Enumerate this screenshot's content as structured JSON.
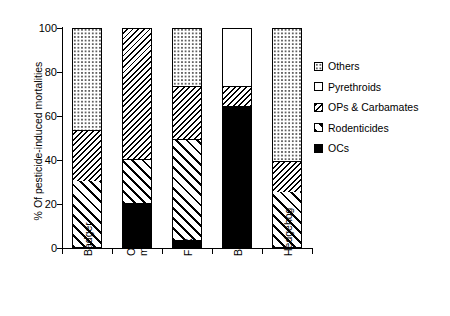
{
  "chart_data": {
    "type": "bar",
    "subtype": "stacked-bar-100",
    "title": "",
    "xlabel": "",
    "ylabel": "% Of pesticide-induced mortalities",
    "ylim": [
      0,
      100
    ],
    "yticks": [
      0,
      20,
      40,
      60,
      80,
      100
    ],
    "grid": false,
    "legend_position": "right",
    "categories": [
      "Badger",
      "Other mustelids",
      "Fox",
      "Bats",
      "Hedgehog"
    ],
    "series": [
      {
        "name": "OCs",
        "pattern": "solid-black",
        "values": [
          0,
          20,
          3,
          64,
          0
        ]
      },
      {
        "name": "Rodenticides",
        "pattern": "diagonal-hatch-forward",
        "values": [
          30,
          20,
          46,
          0,
          25
        ]
      },
      {
        "name": "OPs & Carbamates",
        "pattern": "diagonal-hatch-back",
        "values": [
          23,
          60,
          24,
          9,
          14
        ]
      },
      {
        "name": "Pyrethroids",
        "pattern": "white",
        "values": [
          0,
          0,
          0,
          27,
          0
        ]
      },
      {
        "name": "Others",
        "pattern": "dotted",
        "values": [
          47,
          0,
          27,
          0,
          61
        ]
      }
    ]
  },
  "axis": {
    "y_title": "% Of pesticide-induced mortalities",
    "y_tick_labels": [
      "100",
      "80",
      "60",
      "40",
      "20",
      "0"
    ],
    "x_tick_labels": [
      "Badger",
      "Other\nmustelids",
      "Fox",
      "Bats",
      "Hedgehog"
    ]
  },
  "legend": {
    "items": [
      {
        "label": "Others"
      },
      {
        "label": "Pyrethroids"
      },
      {
        "label": "OPs & Carbamates"
      },
      {
        "label": "Rodenticides"
      },
      {
        "label": "OCs"
      }
    ]
  },
  "colors": {
    "foreground": "#000000",
    "background": "#ffffff"
  }
}
